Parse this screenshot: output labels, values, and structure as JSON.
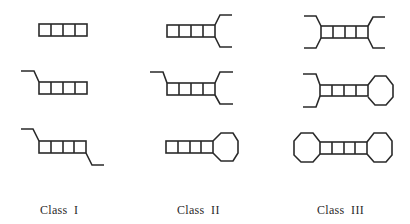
{
  "figure": {
    "columns": [
      {
        "label": "Class  I",
        "items": [
          {
            "shape": "stem-only"
          },
          {
            "shape": "stem-with-left-5prime-tail"
          },
          {
            "shape": "stem-with-left-and-right-tails"
          }
        ]
      },
      {
        "label": "Class  II",
        "items": [
          {
            "shape": "stem-with-right-fork"
          },
          {
            "shape": "stem-with-left-tail-and-right-fork"
          },
          {
            "shape": "stem-with-right-loop"
          }
        ]
      },
      {
        "label": "Class  III",
        "items": [
          {
            "shape": "stem-with-both-forks"
          },
          {
            "shape": "stem-with-left-fork-and-right-loop"
          },
          {
            "shape": "stem-with-both-loops"
          }
        ]
      }
    ],
    "colors": {
      "stroke": "#2a2a2a",
      "background": "#ffffff"
    },
    "stem_rungs": 4
  }
}
